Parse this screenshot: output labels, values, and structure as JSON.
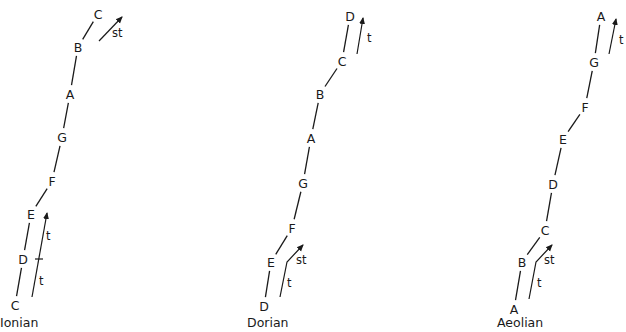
{
  "diagram": {
    "modes": [
      {
        "name": "Ionian",
        "label_pos": [
          0,
          327
        ],
        "notes": [
          {
            "label": "C",
            "x": 15,
            "y": 305
          },
          {
            "label": "D",
            "x": 23,
            "y": 259
          },
          {
            "label": "E",
            "x": 31,
            "y": 214
          },
          {
            "label": "F",
            "x": 52,
            "y": 181
          },
          {
            "label": "G",
            "x": 62,
            "y": 137
          },
          {
            "label": "A",
            "x": 70,
            "y": 94
          },
          {
            "label": "B",
            "x": 78,
            "y": 47
          },
          {
            "label": "C",
            "x": 98,
            "y": 14
          }
        ],
        "arrows": [
          {
            "points": [
              [
                32,
                297
              ],
              [
                47,
                213
              ]
            ],
            "tick": [
              35,
              48,
              259
            ],
            "labels": [
              {
                "text": "t",
                "x": 39,
                "y": 285
              },
              {
                "text": "t",
                "x": 46,
                "y": 240
              }
            ]
          },
          {
            "points": [
              [
                99,
                41
              ],
              [
                122,
                17
              ]
            ],
            "labels": [
              {
                "text": "st",
                "x": 112,
                "y": 37
              }
            ]
          }
        ]
      },
      {
        "name": "Dorian",
        "label_pos": [
          247,
          327
        ],
        "notes": [
          {
            "label": "D",
            "x": 264,
            "y": 306
          },
          {
            "label": "E",
            "x": 271,
            "y": 262
          },
          {
            "label": "F",
            "x": 292,
            "y": 228
          },
          {
            "label": "G",
            "x": 303,
            "y": 183
          },
          {
            "label": "A",
            "x": 311,
            "y": 138
          },
          {
            "label": "B",
            "x": 320,
            "y": 94
          },
          {
            "label": "C",
            "x": 342,
            "y": 61
          },
          {
            "label": "D",
            "x": 350,
            "y": 16
          }
        ],
        "arrows": [
          {
            "points": [
              [
                280,
                297
              ],
              [
                287,
                262
              ],
              [
                303,
                245
              ]
            ],
            "labels": [
              {
                "text": "t",
                "x": 287,
                "y": 287
              },
              {
                "text": "st",
                "x": 296,
                "y": 264
              }
            ]
          },
          {
            "points": [
              [
                357,
                54
              ],
              [
                363,
                18
              ]
            ],
            "labels": [
              {
                "text": "t",
                "x": 367,
                "y": 42
              }
            ]
          }
        ]
      },
      {
        "name": "Aeolian",
        "label_pos": [
          497,
          327
        ],
        "notes": [
          {
            "label": "A",
            "x": 514,
            "y": 309
          },
          {
            "label": "B",
            "x": 522,
            "y": 262
          },
          {
            "label": "C",
            "x": 545,
            "y": 230
          },
          {
            "label": "D",
            "x": 553,
            "y": 184
          },
          {
            "label": "E",
            "x": 563,
            "y": 139
          },
          {
            "label": "F",
            "x": 585,
            "y": 107
          },
          {
            "label": "G",
            "x": 594,
            "y": 62
          },
          {
            "label": "A",
            "x": 601,
            "y": 16
          }
        ],
        "arrows": [
          {
            "points": [
              [
                529,
                299
              ],
              [
                536,
                262
              ],
              [
                552,
                245
              ]
            ],
            "labels": [
              {
                "text": "t",
                "x": 537,
                "y": 287
              },
              {
                "text": "st",
                "x": 544,
                "y": 264
              }
            ]
          },
          {
            "points": [
              [
                609,
                54
              ],
              [
                616,
                19
              ]
            ],
            "labels": [
              {
                "text": "t",
                "x": 619,
                "y": 44
              }
            ]
          }
        ]
      }
    ]
  }
}
